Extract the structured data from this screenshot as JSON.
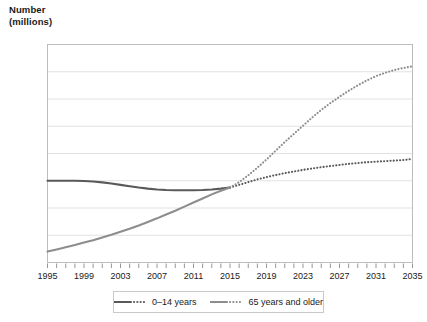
{
  "chart_data": {
    "type": "line",
    "title": "Number\n(millions)",
    "xlabel": "",
    "ylabel": "Number (millions)",
    "xlim": [
      1995,
      2035
    ],
    "ylim": [
      3,
      11
    ],
    "yticks": [
      3,
      4,
      5,
      6,
      7,
      8,
      9,
      10,
      11
    ],
    "xticks": [
      1995,
      1999,
      2003,
      2007,
      2011,
      2015,
      2019,
      2023,
      2027,
      2031,
      2035
    ],
    "xtick_step_minor": 1,
    "grid": "horizontal",
    "legend_position": "bottom",
    "projection_start_year": 2015,
    "x": [
      1995,
      1996,
      1997,
      1998,
      1999,
      2000,
      2001,
      2002,
      2003,
      2004,
      2005,
      2006,
      2007,
      2008,
      2009,
      2010,
      2011,
      2012,
      2013,
      2014,
      2015,
      2016,
      2017,
      2018,
      2019,
      2020,
      2021,
      2022,
      2023,
      2024,
      2025,
      2026,
      2027,
      2028,
      2029,
      2030,
      2031,
      2032,
      2033,
      2034,
      2035
    ],
    "series": [
      {
        "name": "0–14 years",
        "color": "#58595b",
        "style_actual": "solid",
        "style_projection": "dotted",
        "values": [
          6.0,
          6.0,
          6.0,
          6.0,
          5.99,
          5.97,
          5.94,
          5.9,
          5.85,
          5.8,
          5.75,
          5.71,
          5.68,
          5.66,
          5.65,
          5.65,
          5.65,
          5.66,
          5.68,
          5.71,
          5.75,
          5.85,
          5.95,
          6.05,
          6.13,
          6.21,
          6.28,
          6.34,
          6.4,
          6.45,
          6.5,
          6.54,
          6.58,
          6.62,
          6.65,
          6.68,
          6.7,
          6.72,
          6.74,
          6.76,
          6.8
        ]
      },
      {
        "name": "65 years and older",
        "color": "#8d8d8f",
        "style_actual": "solid",
        "style_projection": "dotted",
        "values": [
          3.4,
          3.48,
          3.56,
          3.64,
          3.73,
          3.82,
          3.92,
          4.02,
          4.13,
          4.24,
          4.36,
          4.49,
          4.62,
          4.76,
          4.9,
          5.05,
          5.2,
          5.35,
          5.5,
          5.63,
          5.75,
          5.95,
          6.2,
          6.48,
          6.78,
          7.1,
          7.42,
          7.72,
          8.02,
          8.32,
          8.6,
          8.85,
          9.08,
          9.3,
          9.5,
          9.68,
          9.84,
          9.96,
          10.06,
          10.14,
          10.2
        ]
      }
    ]
  },
  "legend": {
    "items": [
      {
        "label": "0–14 years"
      },
      {
        "label": "65 years and older"
      }
    ]
  },
  "colors": {
    "grid": "#e2e2e2",
    "frame": "#bdbdbd",
    "text": "#1a1a1a",
    "series_young": "#58595b",
    "series_old": "#8d8d8f"
  }
}
